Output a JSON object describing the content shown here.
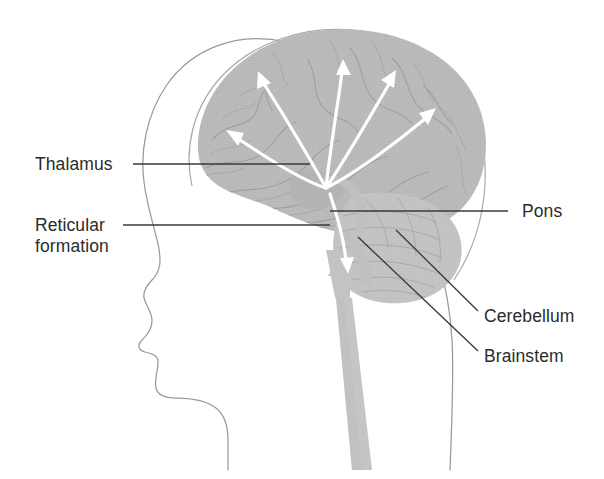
{
  "figure": {
    "background_color": "#ffffff",
    "width": 604,
    "height": 479
  },
  "colors": {
    "brain_fill": "#b9b9b9",
    "brainstem_fill": "#c3c3c3",
    "head_outline": "#9a9a9a",
    "skull_outline": "#a9a9a9",
    "leader_line": "#3a3a3a",
    "arrow": "#ffffff",
    "label_text": "#2b2b2b",
    "sulcus": "#a0a0a0"
  },
  "labels": [
    {
      "id": "thalamus",
      "text": "Thalamus",
      "lines": [
        "Thalamus"
      ],
      "side": "left",
      "text_x": 35,
      "text_y": 170,
      "anchor": "start",
      "leader": "M133,164 L310,164"
    },
    {
      "id": "reticular-formation",
      "text": "Reticular formation",
      "lines": [
        "Reticular",
        "formation"
      ],
      "side": "left",
      "text_x": 35,
      "text_y": 231,
      "line_height": 21,
      "anchor": "start",
      "leader": "M123,225 L330,225"
    },
    {
      "id": "pons",
      "text": "Pons",
      "lines": [
        "Pons"
      ],
      "side": "right",
      "text_x": 522,
      "text_y": 217,
      "anchor": "start",
      "leader": "M508,211 L330,211"
    },
    {
      "id": "cerebellum",
      "text": "Cerebellum",
      "lines": [
        "Cerebellum"
      ],
      "side": "right",
      "text_x": 484,
      "text_y": 322,
      "anchor": "start",
      "leader": "M478,311 L396,230"
    },
    {
      "id": "brainstem",
      "text": "Brainstem",
      "lines": [
        "Brainstem"
      ],
      "side": "right",
      "text_x": 484,
      "text_y": 362,
      "anchor": "start",
      "leader": "M478,351 L358,237"
    }
  ],
  "arrows": {
    "origin": {
      "x": 326,
      "y": 188
    },
    "description": "Ascending white arrows radiating from the reticular formation to the cerebral cortex, plus one descending arrow into the brainstem.",
    "count": 6,
    "paths": [
      {
        "id": "arrow-cortex-frontal-low",
        "d": "M326,188 C296,178 256,150 232,135",
        "tip": {
          "x": 228,
          "y": 132
        },
        "angle": 213
      },
      {
        "id": "arrow-cortex-frontal-high",
        "d": "M326,188 C310,160 281,108 262,78",
        "tip": {
          "x": 259,
          "y": 73
        },
        "angle": 238
      },
      {
        "id": "arrow-cortex-top",
        "d": "M326,188 C330,150 338,100 343,67",
        "tip": {
          "x": 343,
          "y": 61
        },
        "angle": 276
      },
      {
        "id": "arrow-cortex-parietal",
        "d": "M326,188 C348,155 376,105 391,78",
        "tip": {
          "x": 394,
          "y": 72
        },
        "angle": 300
      },
      {
        "id": "arrow-cortex-occipital",
        "d": "M326,188 C360,170 404,134 429,114",
        "tip": {
          "x": 433,
          "y": 110
        },
        "angle": 322
      },
      {
        "id": "arrow-brainstem-down",
        "d": "M330,196 C338,220 344,244 347,264",
        "tip": {
          "x": 348,
          "y": 271
        },
        "angle": 81
      }
    ]
  },
  "structures": [
    {
      "id": "head-profile",
      "name": "head-profile-outline"
    },
    {
      "id": "skull-outline",
      "name": "skull-inner-outline"
    },
    {
      "id": "cerebrum",
      "name": "cerebrum"
    },
    {
      "id": "cerebellum",
      "name": "cerebellum"
    },
    {
      "id": "brainstem",
      "name": "brainstem-and-spinal-cord"
    }
  ]
}
